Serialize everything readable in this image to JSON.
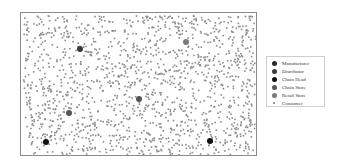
{
  "chart_data": {
    "type": "scatter",
    "title": "",
    "xlabel": "",
    "ylabel": "",
    "grid": false,
    "legend_position": "right",
    "legend": [
      {
        "label": "Manufacturer",
        "color": "#2a2a2a",
        "size": 5
      },
      {
        "label": "Distributor",
        "color": "#3a3a3a",
        "size": 5
      },
      {
        "label": "Chain Head",
        "color": "#111111",
        "size": 5
      },
      {
        "label": "Chain Store",
        "color": "#555555",
        "size": 5
      },
      {
        "label": "Retail Store",
        "color": "#7a7a7a",
        "size": 5
      },
      {
        "label": "Consumer",
        "color": "#8c8c8c",
        "size": 1.5
      }
    ],
    "series": [
      {
        "name": "Distributor",
        "points": [
          [
            59,
            36
          ]
        ]
      },
      {
        "name": "Chain Store",
        "points": [
          [
            118,
            86
          ],
          [
            48,
            100
          ]
        ]
      },
      {
        "name": "Retail Store",
        "points": [
          [
            165,
            29
          ]
        ]
      },
      {
        "name": "Chain Head",
        "points": [
          [
            25,
            129
          ],
          [
            189,
            128
          ]
        ]
      },
      {
        "name": "Consumer",
        "count_approx": 1500,
        "distribution": "uniform random across plot area"
      }
    ]
  }
}
